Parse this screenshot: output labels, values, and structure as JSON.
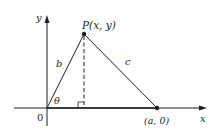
{
  "diagram": {
    "axes": {
      "x_label": "x",
      "y_label": "y",
      "origin_label": "0"
    },
    "points": {
      "P": {
        "label_name": "P",
        "label_coords": "(x, y)"
      },
      "A": {
        "label": "(a, 0)"
      }
    },
    "sides": {
      "b": "b",
      "c": "c"
    },
    "angle": "θ",
    "colors": {
      "ink": "#231f20",
      "dashed": "#231f20"
    }
  }
}
